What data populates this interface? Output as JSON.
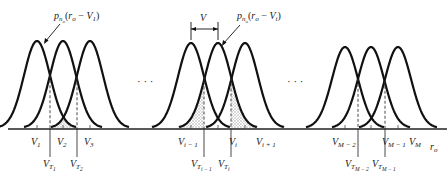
{
  "figure": {
    "axis_label": "r_o",
    "ellipsis": "· · ·",
    "annotations": {
      "curve_label_1": "p",
      "curve_label_1_sub": "n",
      "curve_label_1_subsub": "o",
      "curve_label_1_arg": "(r",
      "curve_label_1_arg_sub": "o",
      "curve_label_1_arg_rest": " − V",
      "curve_label_1_arg_sub2": "1",
      "curve_label_1_close": ")",
      "curve_label_2_arg_sub2": "i",
      "spacing_label": "V"
    },
    "groups": [
      {
        "name": "first",
        "signal_labels": [
          {
            "main": "V",
            "sub": "1"
          },
          {
            "main": "V",
            "sub": "2"
          },
          {
            "main": "V",
            "sub": "3"
          }
        ],
        "threshold_labels": [
          {
            "main": "V",
            "sub": "T",
            "subsub": "1"
          },
          {
            "main": "V",
            "sub": "T",
            "subsub": "2"
          }
        ]
      },
      {
        "name": "middle",
        "signal_labels": [
          {
            "main": "V",
            "sub": "i − 1"
          },
          {
            "main": "V",
            "sub": "i"
          },
          {
            "main": "V",
            "sub": "i + 1"
          }
        ],
        "threshold_labels": [
          {
            "main": "V",
            "sub": "T",
            "subsub": "i − 1"
          },
          {
            "main": "V",
            "sub": "T",
            "subsub": "i"
          }
        ]
      },
      {
        "name": "last",
        "signal_labels": [
          {
            "main": "V",
            "sub": "M − 2"
          },
          {
            "main": "V",
            "sub": "M − 1"
          },
          {
            "main": "V",
            "sub": "M"
          }
        ],
        "threshold_labels": [
          {
            "main": "V",
            "sub": "T",
            "subsub": "M − 2"
          },
          {
            "main": "V",
            "sub": "T",
            "subsub": "M − 1"
          }
        ]
      }
    ],
    "colors": {
      "curve": "#111111",
      "shade": "#cfcfcf",
      "axis": "#222222"
    }
  }
}
